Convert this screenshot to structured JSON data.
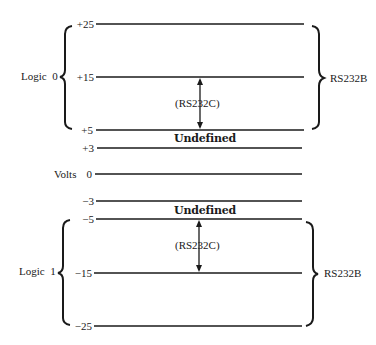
{
  "diagram": {
    "axis_label": "Volts",
    "levels": [
      {
        "label": "+25",
        "value": 25
      },
      {
        "label": "+15",
        "value": 15
      },
      {
        "label": "+5",
        "value": 5
      },
      {
        "label": "+3",
        "value": 3
      },
      {
        "label": "0",
        "value": 0
      },
      {
        "label": "−3",
        "value": -3
      },
      {
        "label": "−5",
        "value": -5
      },
      {
        "label": "−15",
        "value": -15
      },
      {
        "label": "−25",
        "value": -25
      }
    ],
    "logic0_label": "Logic  0",
    "logic1_label": "Logic  1",
    "undefined_upper": "Undefined",
    "undefined_lower": "Undefined",
    "rs232c_upper": "(RS232C)",
    "rs232c_lower": "(RS232C)",
    "rs232b_upper": "RS232B",
    "rs232b_lower": "RS232B"
  }
}
